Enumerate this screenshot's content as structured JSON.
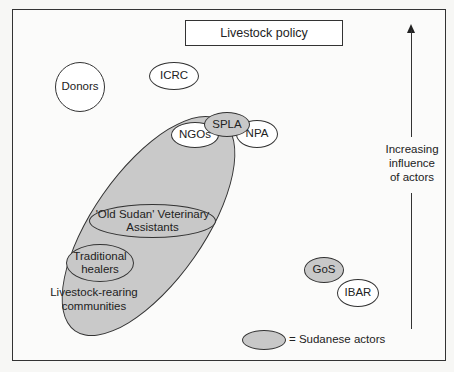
{
  "diagram": {
    "title": "Livestock policy",
    "axis_label": "Increasing influence of actors",
    "axis_label_lines": [
      "Increasing",
      "influence",
      "of actors"
    ],
    "legend": {
      "symbol": "grey-ellipse",
      "label": "= Sudanese actors"
    },
    "colors": {
      "sudanese_fill": "#c8c8c8",
      "other_fill": "#ffffff",
      "stroke": "#333333"
    },
    "actors": [
      {
        "id": "donors",
        "label": "Donors",
        "sudanese": false
      },
      {
        "id": "icrc",
        "label": "ICRC",
        "sudanese": false
      },
      {
        "id": "ngos",
        "label": "NGOs",
        "sudanese": false
      },
      {
        "id": "spla",
        "label": "SPLA",
        "sudanese": true
      },
      {
        "id": "npa",
        "label": "NPA",
        "sudanese": false
      },
      {
        "id": "vet",
        "label_lines": [
          "'Old Sudan' Veterinary",
          "Assistants"
        ],
        "sudanese": true
      },
      {
        "id": "healers",
        "label_lines": [
          "Traditional",
          "healers"
        ],
        "sudanese": true
      },
      {
        "id": "communities",
        "label_lines": [
          "Livestock-rearing",
          "communities"
        ],
        "sudanese": true
      },
      {
        "id": "gos",
        "label": "GoS",
        "sudanese": true
      },
      {
        "id": "ibar",
        "label": "IBAR",
        "sudanese": false
      }
    ]
  }
}
